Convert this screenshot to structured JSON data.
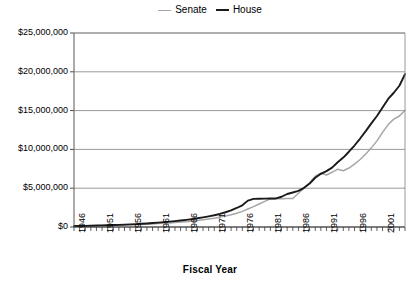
{
  "legend": {
    "position": "top-center",
    "entries": [
      {
        "label": "Senate",
        "color": "#a6a6a6",
        "icon": "line-swatch-icon"
      },
      {
        "label": "House",
        "color": "#1a1a1a",
        "icon": "line-swatch-icon"
      }
    ]
  },
  "axes": {
    "x_title": "Fiscal Year",
    "y_title": "",
    "y_ticks": [
      "$0",
      "$5,000,000",
      "$10,000,000",
      "$15,000,000",
      "$20,000,000",
      "$25,000,000"
    ],
    "x_ticks": [
      "1946",
      "1951",
      "1956",
      "1961",
      "1966",
      "1971",
      "1976",
      "1981",
      "1986",
      "1991",
      "1996",
      "2001"
    ]
  },
  "chart_data": {
    "type": "line",
    "title": "",
    "subtitle": "",
    "xlabel": "Fiscal Year",
    "ylabel": "",
    "xlim": [
      1946,
      2005
    ],
    "ylim": [
      0,
      25000000
    ],
    "ytick_values": [
      0,
      5000000,
      10000000,
      15000000,
      20000000,
      25000000
    ],
    "ytick_labels": [
      "$0",
      "$5,000,000",
      "$10,000,000",
      "$15,000,000",
      "$20,000,000",
      "$25,000,000"
    ],
    "xtick_values": [
      1946,
      1951,
      1956,
      1961,
      1966,
      1971,
      1976,
      1981,
      1986,
      1991,
      1996,
      2001
    ],
    "xtick_labels": [
      "1946",
      "1951",
      "1956",
      "1961",
      "1966",
      "1971",
      "1976",
      "1981",
      "1986",
      "1991",
      "1996",
      "2001"
    ],
    "minor_xticks_every": 1,
    "grid": {
      "horizontal": true,
      "vertical": false
    },
    "legend_position": "top-center",
    "x": [
      1946,
      1947,
      1948,
      1949,
      1950,
      1951,
      1952,
      1953,
      1954,
      1955,
      1956,
      1957,
      1958,
      1959,
      1960,
      1961,
      1962,
      1963,
      1964,
      1965,
      1966,
      1967,
      1968,
      1969,
      1970,
      1971,
      1972,
      1973,
      1974,
      1975,
      1976,
      1977,
      1978,
      1979,
      1980,
      1981,
      1982,
      1983,
      1984,
      1985,
      1986,
      1987,
      1988,
      1989,
      1990,
      1991,
      1992,
      1993,
      1994,
      1995,
      1996,
      1997,
      1998,
      1999,
      2000,
      2001,
      2002,
      2003,
      2004,
      2005
    ],
    "series": [
      {
        "name": "Senate",
        "color": "#a6a6a6",
        "values": [
          110000,
          120000,
          135000,
          150000,
          165000,
          180000,
          195000,
          215000,
          235000,
          255000,
          280000,
          305000,
          335000,
          365000,
          400000,
          440000,
          480000,
          525000,
          575000,
          630000,
          690000,
          760000,
          840000,
          930000,
          1030000,
          1140000,
          1270000,
          1420000,
          1590000,
          1780000,
          2010000,
          2320000,
          2620000,
          2960000,
          3300000,
          3620000,
          3640000,
          3650000,
          3660000,
          3680000,
          4350000,
          5000000,
          5700000,
          6550000,
          6950000,
          6700000,
          7050000,
          7450000,
          7250000,
          7600000,
          8100000,
          8700000,
          9400000,
          10200000,
          11100000,
          12200000,
          13200000,
          13900000,
          14300000,
          15050000
        ]
      },
      {
        "name": "House",
        "color": "#1a1a1a",
        "values": [
          120000,
          135000,
          150000,
          170000,
          190000,
          210000,
          230000,
          255000,
          280000,
          310000,
          340000,
          375000,
          415000,
          460000,
          510000,
          565000,
          625000,
          690000,
          760000,
          840000,
          925000,
          1020000,
          1125000,
          1240000,
          1370000,
          1510000,
          1680000,
          1900000,
          2150000,
          2450000,
          2800000,
          3400000,
          3620000,
          3650000,
          3660000,
          3670000,
          3680000,
          3900000,
          4250000,
          4450000,
          4650000,
          5050000,
          5600000,
          6350000,
          6850000,
          7200000,
          7650000,
          8350000,
          8950000,
          9700000,
          10500000,
          11400000,
          12350000,
          13350000,
          14300000,
          15400000,
          16500000,
          17300000,
          18200000,
          19700000
        ]
      }
    ]
  }
}
